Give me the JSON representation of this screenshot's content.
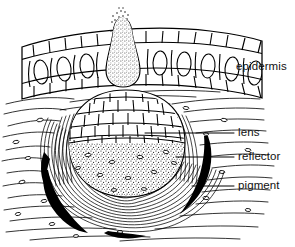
{
  "figure": {
    "background_color": "#ffffff",
    "ink_color": "#000000",
    "width": 295,
    "height": 247
  },
  "labels": [
    {
      "id": "epidermis",
      "text": "epidermis",
      "x": 236,
      "y": 61,
      "has_leader_line": false
    },
    {
      "id": "lens",
      "text": "lens",
      "x": 238,
      "y": 127,
      "has_leader_line": true,
      "leader": {
        "x1": 145,
        "y1": 133,
        "x2": 234,
        "y2": 133
      }
    },
    {
      "id": "reflector",
      "text": "reflector",
      "x": 238,
      "y": 151,
      "has_leader_line": true,
      "leader": {
        "x1": 176,
        "y1": 157,
        "x2": 234,
        "y2": 157
      }
    },
    {
      "id": "pigment",
      "text": "pigment",
      "x": 238,
      "y": 180,
      "has_leader_line": true,
      "leader": {
        "x1": 192,
        "y1": 186,
        "x2": 234,
        "y2": 186
      }
    }
  ],
  "structures": {
    "epidermis": {
      "name": "epidermis",
      "description": "banded cell layer across the top with small polygonal cells above and below a row of large oval cells",
      "top_row_cells": 14,
      "oval_cells": 7,
      "bottom_row_cells": 14
    },
    "papilla": {
      "name": "stippled-papilla",
      "description": "teardrop shaped stippled structure protruding through the epidermis with a puff of dots at its tip"
    },
    "lens": {
      "name": "lens",
      "description": "dome of irregular polygonal cells filling the upper half of the eye capsule",
      "cell_count": 46
    },
    "pigment_cup": {
      "name": "pigment-cup",
      "description": "stippled cup below the lens containing scattered dark cell outlines"
    },
    "reflector": {
      "name": "reflector",
      "description": "concentric striated arcs wrapping around the outside of the eye capsule",
      "arc_count": 16
    },
    "pigment_crescents": {
      "name": "pigment-crescents",
      "description": "solid black crescents on the lower left, lower right and base of the eye",
      "count": 3,
      "color": "#000000"
    },
    "dermis": {
      "name": "dermis-tissue",
      "description": "wavy horizontal fibre lines with scattered small lens-shaped nuclei surrounding the eye"
    }
  }
}
